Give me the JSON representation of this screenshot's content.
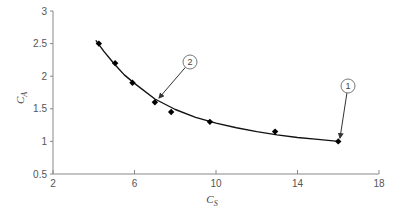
{
  "chart_data": {
    "type": "scatter",
    "title": "",
    "xlabel": "C_S",
    "ylabel": "C_A",
    "xlim": [
      2,
      18
    ],
    "ylim": [
      0.5,
      3
    ],
    "x_ticks": [
      2,
      6,
      10,
      14,
      18
    ],
    "y_ticks": [
      0.5,
      1,
      1.5,
      2,
      2.5,
      3
    ],
    "grid": false,
    "legend": null,
    "series": [
      {
        "name": "data points",
        "marker": "diamond",
        "x": [
          4.25,
          5.05,
          5.9,
          7.0,
          7.8,
          9.7,
          12.9,
          16.0
        ],
        "y": [
          2.5,
          2.2,
          1.9,
          1.6,
          1.45,
          1.3,
          1.15,
          1.0
        ]
      },
      {
        "name": "fitted curve",
        "style": "line",
        "x": [
          4.1,
          4.5,
          5.0,
          5.5,
          6.0,
          7.0,
          8.0,
          9.0,
          10.0,
          11.0,
          12.0,
          13.0,
          14.0,
          15.0,
          16.0
        ],
        "y": [
          2.55,
          2.38,
          2.19,
          2.02,
          1.89,
          1.65,
          1.49,
          1.37,
          1.28,
          1.21,
          1.15,
          1.1,
          1.06,
          1.03,
          1.0
        ]
      }
    ],
    "annotations": [
      {
        "label": "1",
        "points_to": [
          16.0,
          1.0
        ]
      },
      {
        "label": "2",
        "points_to": [
          7.0,
          1.6
        ]
      }
    ]
  },
  "axes": {
    "x_title_main": "C",
    "x_title_sub": "S",
    "y_title_main": "C",
    "y_title_sub": "A"
  }
}
